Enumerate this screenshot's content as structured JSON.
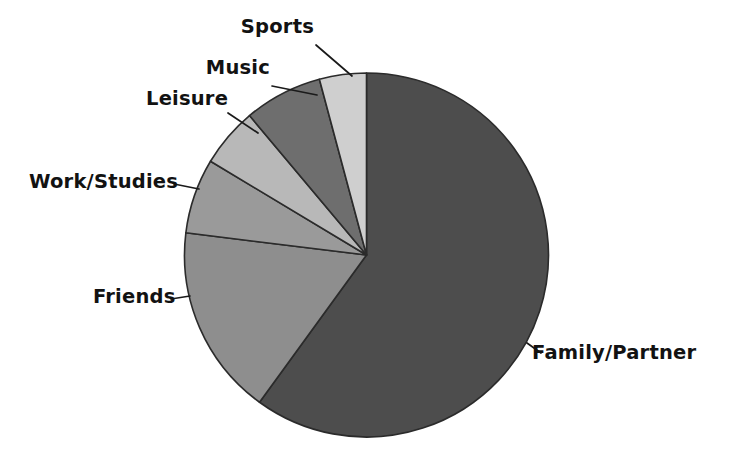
{
  "chart_data": {
    "type": "pie",
    "title": "",
    "subtitle": "",
    "xlabel": "",
    "ylabel": "",
    "legend_position": "none",
    "grid": false,
    "labels_outside": true,
    "start_angle_deg": 0,
    "direction": "clockwise",
    "categories": [
      "Family/Partner",
      "Friends",
      "Work/Studies",
      "Leisure",
      "Music",
      "Sports"
    ],
    "values": [
      60,
      17,
      6.5,
      5.5,
      7,
      4
    ],
    "units": "percent",
    "series": [
      {
        "name": "Share of time",
        "values": [
          60,
          17,
          6.5,
          5.5,
          7,
          4
        ]
      }
    ],
    "slices": [
      {
        "label": "Family/Partner",
        "value": 60,
        "start_deg": 0,
        "end_deg": 216,
        "color": "#4d4d4d"
      },
      {
        "label": "Friends",
        "value": 17,
        "start_deg": 216,
        "end_deg": 277,
        "color": "#8e8e8e"
      },
      {
        "label": "Work/Studies",
        "value": 6.5,
        "start_deg": 277,
        "end_deg": 301,
        "color": "#9a9a9a"
      },
      {
        "label": "Leisure",
        "value": 5.5,
        "start_deg": 301,
        "end_deg": 320,
        "color": "#b8b8b8"
      },
      {
        "label": "Music",
        "value": 7,
        "start_deg": 320,
        "end_deg": 345,
        "color": "#6e6e6e"
      },
      {
        "label": "Sports",
        "value": 4,
        "start_deg": 345,
        "end_deg": 360,
        "color": "#cfcfcf"
      }
    ],
    "colors": [
      "#4d4d4d",
      "#8e8e8e",
      "#9a9a9a",
      "#b8b8b8",
      "#6e6e6e",
      "#cfcfcf"
    ],
    "background_color": "#ffffff",
    "outline_color": "#2b2b2b"
  },
  "labels": {
    "family_partner": "Family/Partner",
    "friends": "Friends",
    "work_studies": "Work/Studies",
    "leisure": "Leisure",
    "music": "Music",
    "sports": "Sports"
  }
}
